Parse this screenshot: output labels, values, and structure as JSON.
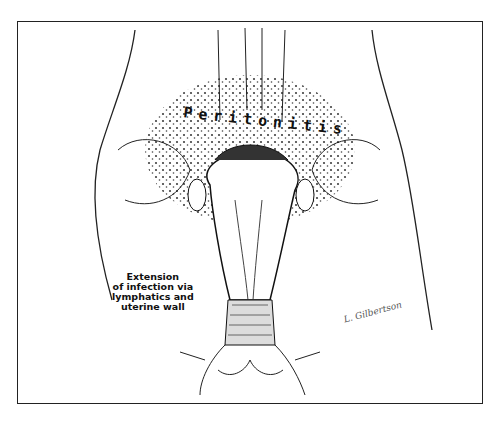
{
  "illustration": {
    "title_label": "Peritonitis",
    "caption": "Extension\nof infection via\nlymphatics and\nuterine wall",
    "signature": "L. Gilbertson",
    "colors": {
      "ink": "#111111",
      "paper": "#ffffff"
    }
  }
}
